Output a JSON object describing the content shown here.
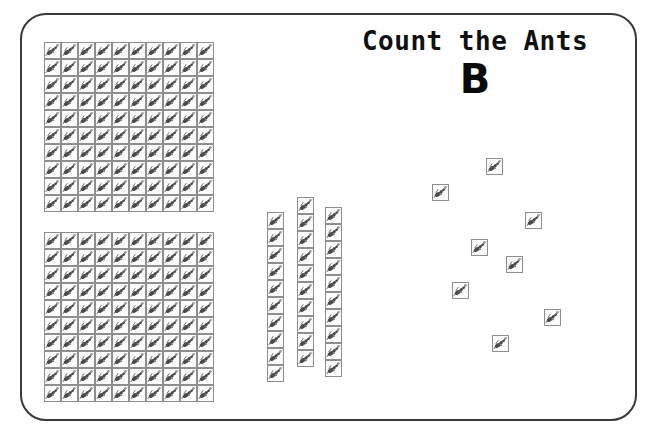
{
  "worksheet": {
    "title": "Count the Ants",
    "version_label": "B",
    "icon_name": "ant-icon",
    "border_color": "#3a3a3a",
    "cell_border_color": "#8e8e8e",
    "ant_color": "#4a4a4a",
    "background_color": "#ffffff"
  },
  "chart_data": {
    "type": "table",
    "title": "Count the Ants",
    "subtitle": "B",
    "unit": "ant",
    "groups": [
      {
        "name": "hundred-block-1",
        "kind": "grid",
        "rows": 10,
        "cols": 10,
        "count": 100,
        "x": 44,
        "y": 42,
        "cell": 17
      },
      {
        "name": "hundred-block-2",
        "kind": "grid",
        "rows": 10,
        "cols": 10,
        "count": 100,
        "x": 44,
        "y": 232,
        "cell": 17
      },
      {
        "name": "ten-strip-1",
        "kind": "strip",
        "rows": 10,
        "cols": 1,
        "count": 10,
        "x": 267,
        "y": 212,
        "cell": 17
      },
      {
        "name": "ten-strip-2",
        "kind": "strip",
        "rows": 10,
        "cols": 1,
        "count": 10,
        "x": 297,
        "y": 197,
        "cell": 17
      },
      {
        "name": "ten-strip-3",
        "kind": "strip",
        "rows": 10,
        "cols": 1,
        "count": 10,
        "x": 325,
        "y": 207,
        "cell": 17
      },
      {
        "name": "loose-ants",
        "kind": "scatter",
        "count": 8,
        "positions": [
          {
            "x": 486,
            "y": 158
          },
          {
            "x": 432,
            "y": 184
          },
          {
            "x": 525,
            "y": 212
          },
          {
            "x": 471,
            "y": 239
          },
          {
            "x": 506,
            "y": 256
          },
          {
            "x": 452,
            "y": 282
          },
          {
            "x": 544,
            "y": 309
          },
          {
            "x": 492,
            "y": 335
          }
        ]
      }
    ],
    "totals": {
      "hundreds": 2,
      "tens": 3,
      "ones": 8,
      "total": 238
    }
  }
}
